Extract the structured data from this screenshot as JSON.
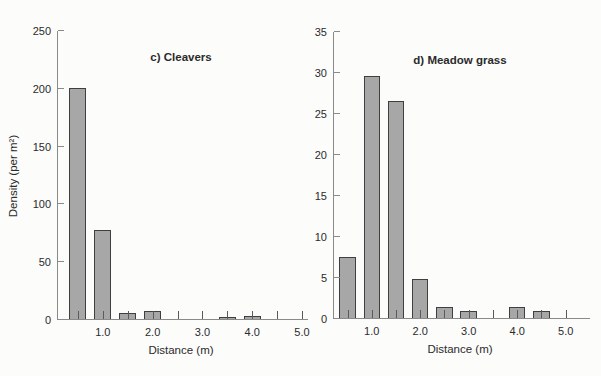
{
  "style": {
    "background": "#fcfcfb",
    "bar_fill": "#a7a7a7",
    "bar_border": "#3f3f3f",
    "axis_color": "#8a8a8a",
    "tick_color": "#5a5a5a",
    "text_color": "#2b2b2b"
  },
  "chart_data": [
    {
      "type": "bar",
      "title": "c) Cleavers",
      "xlabel": "Distance (m)",
      "ylabel": "Density (per m²)",
      "categories": [
        0.5,
        1.0,
        1.5,
        2.0,
        2.5,
        3.0,
        3.5,
        4.0,
        4.5,
        5.0
      ],
      "values": [
        200,
        77,
        5,
        7,
        0,
        0,
        2,
        3,
        0,
        0
      ],
      "ylim": [
        0,
        250
      ],
      "xlim": [
        0.08,
        5.06
      ],
      "grid": false,
      "legend": null,
      "y_ticks": [
        {
          "v": 0,
          "text": "0"
        },
        {
          "v": 50,
          "text": "50"
        },
        {
          "v": 100,
          "text": "100"
        },
        {
          "v": 150,
          "text": "150"
        },
        {
          "v": 200,
          "text": "200"
        },
        {
          "v": 250,
          "text": "250"
        }
      ],
      "x_ticks": [
        0.5,
        1.0,
        1.5,
        2.0,
        2.5,
        3.0,
        3.5,
        4.0,
        4.5,
        5.0
      ],
      "x_tick_labels": [
        {
          "x": 1.0,
          "text": "1.0"
        },
        {
          "x": 2.0,
          "text": "2.0"
        },
        {
          "x": 3.0,
          "text": "3.0"
        },
        {
          "x": 4.0,
          "text": "4.0"
        },
        {
          "x": 5.0,
          "text": "5.0"
        }
      ]
    },
    {
      "type": "bar",
      "title": "d) Meadow grass",
      "xlabel": "Distance (m)",
      "ylabel": null,
      "categories": [
        0.5,
        1.0,
        1.5,
        2.0,
        2.5,
        3.0,
        3.5,
        4.0,
        4.5,
        5.0
      ],
      "values": [
        7.5,
        29.5,
        26.5,
        4.7,
        1.4,
        0.8,
        0,
        1.4,
        0.8,
        0
      ],
      "ylim": [
        0,
        35
      ],
      "xlim": [
        0.2,
        5.44
      ],
      "grid": false,
      "legend": null,
      "y_ticks": [
        {
          "v": 0,
          "text": "0"
        },
        {
          "v": 5,
          "text": "5"
        },
        {
          "v": 10,
          "text": "10"
        },
        {
          "v": 15,
          "text": "15"
        },
        {
          "v": 20,
          "text": "20"
        },
        {
          "v": 25,
          "text": "25"
        },
        {
          "v": 30,
          "text": "30"
        },
        {
          "v": 35,
          "text": "35"
        }
      ],
      "x_ticks": [
        0.5,
        1.0,
        1.5,
        2.0,
        2.5,
        3.0,
        3.5,
        4.0,
        4.5,
        5.0
      ],
      "x_tick_labels": [
        {
          "x": 1.0,
          "text": "1.0"
        },
        {
          "x": 2.0,
          "text": "2.0"
        },
        {
          "x": 3.0,
          "text": "3.0"
        },
        {
          "x": 4.0,
          "text": "4.0"
        },
        {
          "x": 5.0,
          "text": "5.0"
        }
      ]
    }
  ]
}
